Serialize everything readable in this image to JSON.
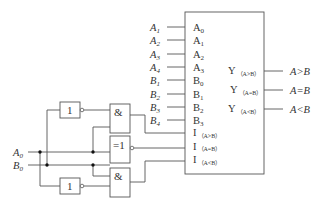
{
  "diagram": {
    "type": "4-bit magnitude comparator with cascade logic",
    "chip": {
      "inputs": [
        {
          "ext": "A",
          "ext_sub": "1",
          "pin": "A",
          "pin_sub": "0"
        },
        {
          "ext": "A",
          "ext_sub": "2",
          "pin": "A",
          "pin_sub": "1"
        },
        {
          "ext": "A",
          "ext_sub": "3",
          "pin": "A",
          "pin_sub": "2"
        },
        {
          "ext": "A",
          "ext_sub": "4",
          "pin": "A",
          "pin_sub": "3"
        },
        {
          "ext": "B",
          "ext_sub": "1",
          "pin": "B",
          "pin_sub": "0"
        },
        {
          "ext": "B",
          "ext_sub": "2",
          "pin": "B",
          "pin_sub": "1"
        },
        {
          "ext": "B",
          "ext_sub": "3",
          "pin": "B",
          "pin_sub": "2"
        },
        {
          "ext": "B",
          "ext_sub": "4",
          "pin": "B",
          "pin_sub": "3"
        }
      ],
      "cascade_inputs": [
        {
          "pin": "I",
          "pin_sub": "（A>B）"
        },
        {
          "pin": "I",
          "pin_sub": "（A=B）"
        },
        {
          "pin": "I",
          "pin_sub": "（A<B）"
        }
      ],
      "outputs": [
        {
          "pin": "Y",
          "pin_sub": "（A>B）",
          "ext": "A>B"
        },
        {
          "pin": "Y",
          "pin_sub": "（A=B）",
          "ext": "A=B"
        },
        {
          "pin": "Y",
          "pin_sub": "（A<B）",
          "ext": "A<B"
        }
      ]
    },
    "signals": {
      "a0": {
        "name": "A",
        "sub": "0"
      },
      "b0": {
        "name": "B",
        "sub": "0"
      }
    },
    "gates": {
      "not_top": "1",
      "and_top": "&",
      "xnor": "=1",
      "and_bottom": "&",
      "not_bottom": "1"
    }
  }
}
